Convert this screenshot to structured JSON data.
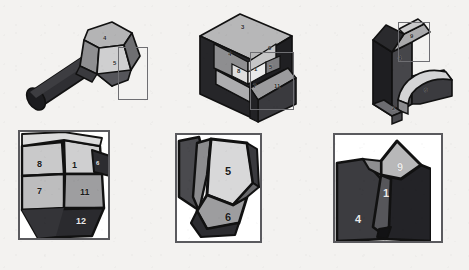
{
  "figure": {
    "background_color": "#f3f2f0",
    "outline_color": "#111111",
    "callout_frame_color": "#6e6e72",
    "detail_frame_color": "#5a5a5e"
  },
  "palette": {
    "dark": "#2f2f33",
    "darker": "#232326",
    "mid_dark": "#4a4a4e",
    "mid": "#7d7d80",
    "mid_light": "#9a9a9c",
    "light": "#bdbdbe",
    "lighter": "#d2d2d2",
    "lightest": "#e4e4e4",
    "white": "#ffffff"
  },
  "overview_row": {
    "panels": [
      {
        "id": "overview-bolt",
        "name": "bolt-specimen",
        "callout": {
          "x": 118,
          "y": 47,
          "width": 30,
          "height": 53
        },
        "facet_labels": [
          {
            "text": "4",
            "x": 103,
            "y": 40
          },
          {
            "text": "5",
            "x": 120,
            "y": 63
          }
        ]
      },
      {
        "id": "overview-block",
        "name": "sectioned-block-specimen",
        "callout": {
          "x": 250,
          "y": 52,
          "width": 44,
          "height": 58
        },
        "facet_labels": [
          {
            "text": "3",
            "x": 233,
            "y": 26
          },
          {
            "text": "4",
            "x": 226,
            "y": 53
          },
          {
            "text": "9",
            "x": 267,
            "y": 45
          },
          {
            "text": "8",
            "x": 238,
            "y": 70
          },
          {
            "text": "1",
            "x": 252,
            "y": 70
          },
          {
            "text": "5",
            "x": 265,
            "y": 69
          },
          {
            "text": "7",
            "x": 250,
            "y": 84
          },
          {
            "text": "11",
            "x": 271,
            "y": 84
          }
        ]
      },
      {
        "id": "overview-bracket",
        "name": "l-bracket-specimen",
        "callout": {
          "x": 398,
          "y": 22,
          "width": 32,
          "height": 40
        },
        "facet_labels": [
          {
            "text": "9",
            "x": 408,
            "y": 36
          },
          {
            "text": "4",
            "x": 397,
            "y": 56
          },
          {
            "text": "6",
            "x": 420,
            "y": 91
          },
          {
            "text": "2",
            "x": 399,
            "y": 97
          }
        ]
      }
    ]
  },
  "detail_row": {
    "panels": [
      {
        "id": "detail-left",
        "name": "detail-view-bolt-facets",
        "frame": {
          "x": 18,
          "y": 130,
          "width": 92,
          "height": 110
        },
        "labels": [
          {
            "text": "8",
            "x": 37,
            "y": 165
          },
          {
            "text": "1",
            "x": 71,
            "y": 166
          },
          {
            "text": "6",
            "x": 94,
            "y": 163,
            "style": "tiny"
          },
          {
            "text": "7",
            "x": 36,
            "y": 190
          },
          {
            "text": "11",
            "x": 84,
            "y": 191
          },
          {
            "text": "12",
            "x": 79,
            "y": 218
          }
        ]
      },
      {
        "id": "detail-middle",
        "name": "detail-view-block-facets",
        "frame": {
          "x": 175,
          "y": 133,
          "width": 87,
          "height": 110
        },
        "labels": [
          {
            "text": "5",
            "x": 226,
            "y": 167
          },
          {
            "text": "6",
            "x": 227,
            "y": 215
          }
        ]
      },
      {
        "id": "detail-right",
        "name": "detail-view-bracket-facets",
        "frame": {
          "x": 333,
          "y": 133,
          "width": 110,
          "height": 110
        },
        "labels": [
          {
            "text": "9",
            "x": 397,
            "y": 165
          },
          {
            "text": "1",
            "x": 386,
            "y": 192
          },
          {
            "text": "4",
            "x": 357,
            "y": 217
          }
        ]
      }
    ]
  }
}
